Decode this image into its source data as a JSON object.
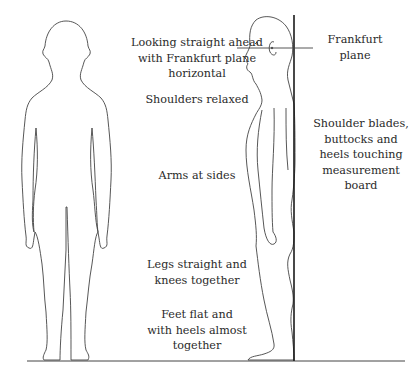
{
  "diagram": {
    "colors": {
      "line": "#444444",
      "board": "#1a1a1a",
      "text": "#2a2a2a",
      "background": "#ffffff"
    },
    "figures": [
      {
        "id": "front-view",
        "description": "Child standing, front view"
      },
      {
        "id": "side-view",
        "description": "Child standing, side view against measurement board"
      }
    ],
    "labels": {
      "frankfurt_instruction": [
        "Looking straight ahead",
        "with Frankfurt plane",
        "horizontal"
      ],
      "shoulders": [
        "Shoulders relaxed"
      ],
      "arms": [
        "Arms at sides"
      ],
      "legs": [
        "Legs straight and",
        "knees together"
      ],
      "feet": [
        "Feet flat and",
        "with heels almost",
        "together"
      ],
      "frankfurt_plane": [
        "Frankfurt",
        "plane"
      ],
      "board_contact": [
        "Shoulder blades,",
        "buttocks and",
        "heels touching",
        "measurement",
        "board"
      ]
    }
  }
}
